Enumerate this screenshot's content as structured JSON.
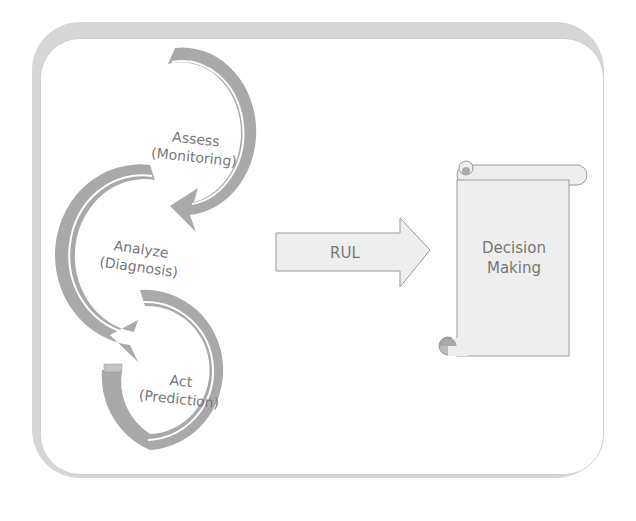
{
  "cycle": [
    {
      "title": "Assess",
      "subtitle": "(Monitoring)"
    },
    {
      "title": "Analyze",
      "subtitle": "(Diagnosis)"
    },
    {
      "title": "Act",
      "subtitle": "(Prediction)"
    }
  ],
  "arrow": {
    "label": "RUL"
  },
  "scroll": {
    "line1": "Decision",
    "line2": "Making"
  },
  "colors": {
    "ring": "#a9a9a9",
    "ring_light": "#c4c4c4",
    "frame": "#d6d6d6",
    "text": "#777777",
    "shape_fill": "#eeeeee",
    "shape_stroke": "#999999"
  }
}
